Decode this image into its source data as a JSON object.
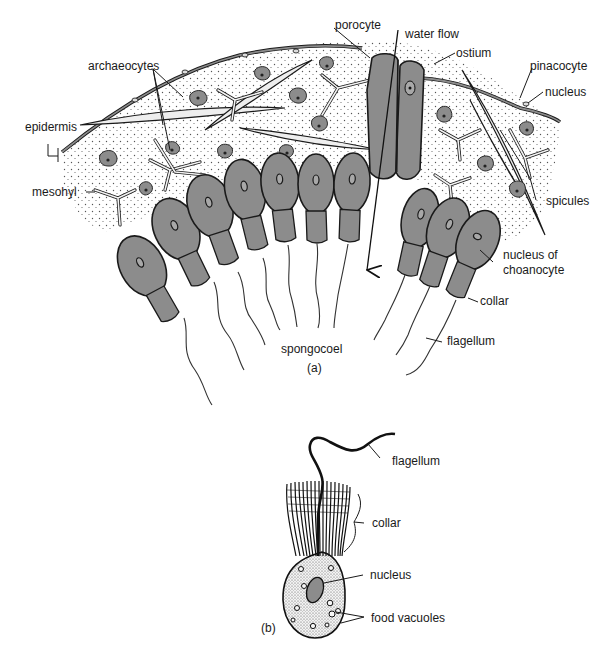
{
  "figure": {
    "panel_a": {
      "caption": "(a)",
      "labels": {
        "archaeocytes": "archaeocytes",
        "epidermis": "epidermis",
        "mesohyl": "mesohyl",
        "porocyte": "porocyte",
        "water_flow": "water flow",
        "ostium": "ostium",
        "pinacocyte": "pinacocyte",
        "nucleus": "nucleus",
        "spicules": "spicules",
        "nucleus_of_choanocyte_line1": "nucleus of",
        "nucleus_of_choanocyte_line2": "choanocyte",
        "collar": "collar",
        "flagellum": "flagellum",
        "spongocoel": "spongocoel"
      }
    },
    "panel_b": {
      "caption": "(b)",
      "labels": {
        "flagellum": "flagellum",
        "collar": "collar",
        "nucleus": "nucleus",
        "food_vacuoles": "food vacuoles"
      }
    },
    "colors": {
      "cell_fill": "#8c8c8c",
      "outline": "#1a1a1a",
      "mesohyl_dots": "#555555",
      "background": "#ffffff"
    }
  }
}
